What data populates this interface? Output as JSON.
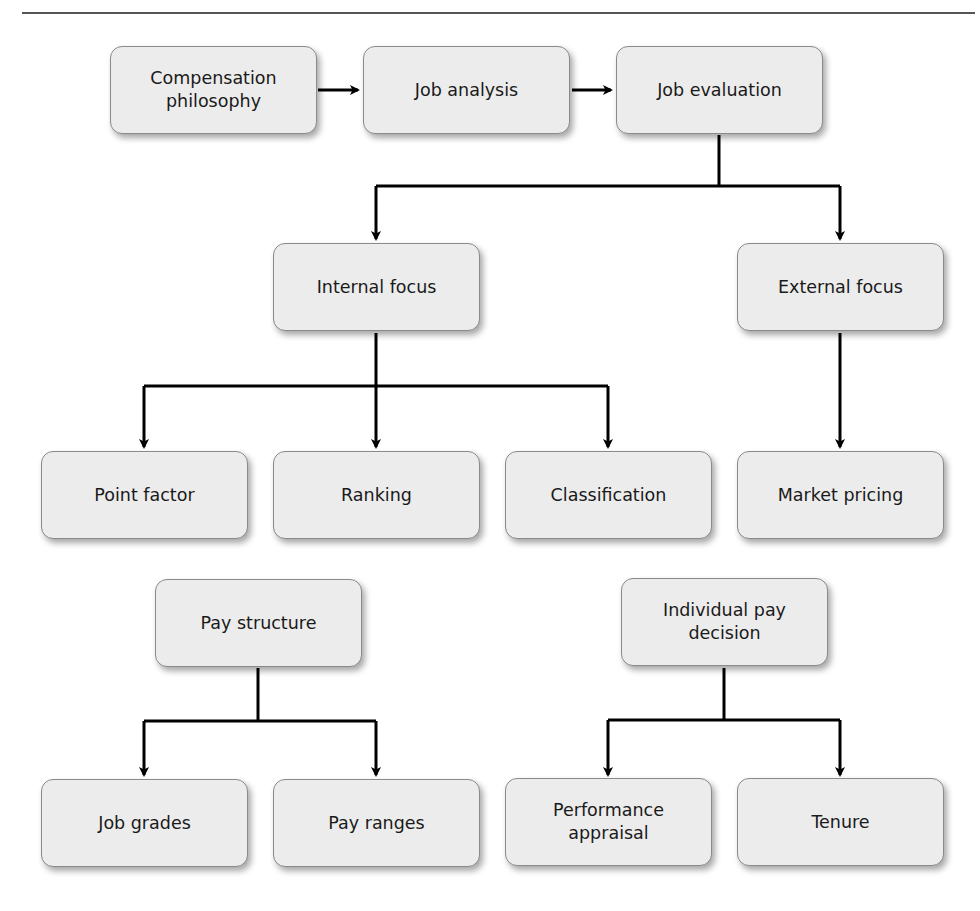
{
  "diagram": {
    "type": "flowchart",
    "nodes": {
      "compensation_philosophy": {
        "label": "Compensation\nphilosophy"
      },
      "job_analysis": {
        "label": "Job analysis"
      },
      "job_evaluation": {
        "label": "Job evaluation"
      },
      "internal_focus": {
        "label": "Internal focus"
      },
      "external_focus": {
        "label": "External focus"
      },
      "point_factor": {
        "label": "Point factor"
      },
      "ranking": {
        "label": "Ranking"
      },
      "classification": {
        "label": "Classification"
      },
      "market_pricing": {
        "label": "Market pricing"
      },
      "pay_structure": {
        "label": "Pay structure"
      },
      "individual_pay_decision": {
        "label": "Individual pay\ndecision"
      },
      "job_grades": {
        "label": "Job grades"
      },
      "pay_ranges": {
        "label": "Pay ranges"
      },
      "performance_appraisal": {
        "label": "Performance\nappraisal"
      },
      "tenure": {
        "label": "Tenure"
      }
    },
    "edges": [
      {
        "from": "compensation_philosophy",
        "to": "job_analysis"
      },
      {
        "from": "job_analysis",
        "to": "job_evaluation"
      },
      {
        "from": "job_evaluation",
        "to": "internal_focus"
      },
      {
        "from": "job_evaluation",
        "to": "external_focus"
      },
      {
        "from": "internal_focus",
        "to": "point_factor"
      },
      {
        "from": "internal_focus",
        "to": "ranking"
      },
      {
        "from": "internal_focus",
        "to": "classification"
      },
      {
        "from": "external_focus",
        "to": "market_pricing"
      },
      {
        "from": "pay_structure",
        "to": "job_grades"
      },
      {
        "from": "pay_structure",
        "to": "pay_ranges"
      },
      {
        "from": "individual_pay_decision",
        "to": "performance_appraisal"
      },
      {
        "from": "individual_pay_decision",
        "to": "tenure"
      }
    ],
    "colors": {
      "box_fill": "#ececec",
      "box_border": "#8a8a8a",
      "line": "#000000",
      "text": "#1a1a1a"
    }
  }
}
